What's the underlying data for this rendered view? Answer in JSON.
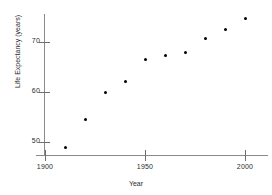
{
  "chart_data": {
    "type": "scatter",
    "title": "",
    "xlabel": "Year",
    "ylabel": "Life Expectancy (years)",
    "x": [
      1910,
      1920,
      1930,
      1940,
      1950,
      1960,
      1970,
      1980,
      1990,
      2000
    ],
    "values": [
      49.0,
      54.5,
      60.0,
      62.2,
      66.5,
      67.4,
      68.0,
      70.8,
      72.6,
      74.8
    ],
    "series": [
      {
        "name": "Life Expectancy",
        "values": [
          49.0,
          54.5,
          60.0,
          62.2,
          66.5,
          67.4,
          68.0,
          70.8,
          72.6,
          74.8
        ]
      }
    ],
    "points": [
      {
        "x": 1910,
        "y": 49.0
      },
      {
        "x": 1920,
        "y": 54.5
      },
      {
        "x": 1930,
        "y": 60.0
      },
      {
        "x": 1940,
        "y": 62.2
      },
      {
        "x": 1950,
        "y": 66.5
      },
      {
        "x": 1960,
        "y": 67.4
      },
      {
        "x": 1970,
        "y": 68.0
      },
      {
        "x": 1980,
        "y": 70.8
      },
      {
        "x": 1990,
        "y": 72.6
      },
      {
        "x": 2000,
        "y": 74.8
      }
    ],
    "xlim": [
      1897,
      2013
    ],
    "ylim": [
      47.5,
      78.5
    ],
    "xticks": [
      1900,
      1950,
      2000
    ],
    "xtick_labels": [
      "1900",
      "1950",
      "2000"
    ],
    "yticks": [
      50,
      60,
      70
    ],
    "ytick_labels": [
      "50",
      "60",
      "70"
    ],
    "grid": false,
    "legend": false,
    "marker_color": "#000000",
    "axis_color": "#8a8a8a",
    "background_color": "#ffffff"
  }
}
